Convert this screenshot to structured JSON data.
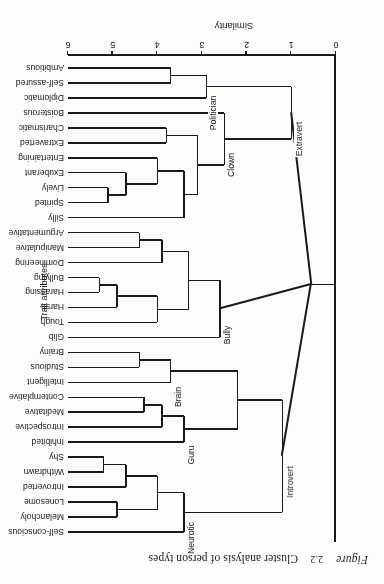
{
  "caption": {
    "figure_word": "Figure",
    "number": "2.2",
    "text": "Cluster analysis of person types"
  },
  "axes": {
    "x_label": "Similarity",
    "x_ticks": [
      "0",
      "1",
      "2",
      "3",
      "4",
      "5",
      "6"
    ],
    "x_min": 0,
    "x_max": 6,
    "right_label": "Trait attributes"
  },
  "chart_data": {
    "type": "dendrogram",
    "title": "Cluster analysis of person types",
    "xlabel": "Similarity",
    "ylabel": "Trait attributes",
    "xlim": [
      0,
      6
    ],
    "grid": false,
    "legend": "none",
    "orientation": "horizontal-rotated-180",
    "leaves": [
      "Self-conscious",
      "Melancholy",
      "Lonesome",
      "Introverted",
      "Withdrawn",
      "Shy",
      "Inhibited",
      "Introspective",
      "Meditative",
      "Contemplative",
      "Intelligent",
      "Studious",
      "Brainy",
      "Glib",
      "Tough",
      "Harsh",
      "Harassing",
      "Bullying",
      "Domineering",
      "Manipulative",
      "Argumentative",
      "Silly",
      "Spirited",
      "Lively",
      "Exuberant",
      "Entertaining",
      "Extraverted",
      "Charismatic",
      "Boisterous",
      "Diplomatic",
      "Self-assured",
      "Ambitious"
    ],
    "cluster_labels": [
      "Neurotic",
      "Guru",
      "Brain",
      "Introvert",
      "Bully",
      "Clown",
      "Politician",
      "Extravert"
    ],
    "merges": [
      {
        "name": "Withdrawn-Shy",
        "height": 5.2,
        "members": [
          "Withdrawn",
          "Shy"
        ]
      },
      {
        "name": "Introverted-WithdrawnShy",
        "height": 4.7,
        "members": [
          "Introverted",
          "Withdrawn",
          "Shy"
        ]
      },
      {
        "name": "Melancholy-Lonesome",
        "height": 4.9,
        "members": [
          "Melancholy",
          "Lonesome"
        ]
      },
      {
        "name": "Neurotic-inner",
        "height": 4.0,
        "members": [
          "Melancholy",
          "Lonesome",
          "Introverted",
          "Withdrawn",
          "Shy"
        ]
      },
      {
        "name": "Neurotic",
        "height": 3.4,
        "members": [
          "Self-conscious",
          "Melancholy",
          "Lonesome",
          "Introverted",
          "Withdrawn",
          "Shy"
        ]
      },
      {
        "name": "Meditative-Contemplative",
        "height": 4.3,
        "members": [
          "Meditative",
          "Contemplative"
        ]
      },
      {
        "name": "Guru",
        "height": 3.4,
        "members": [
          "Inhibited",
          "Introspective",
          "Meditative",
          "Contemplative"
        ]
      },
      {
        "name": "Studious-Brainy",
        "height": 4.4,
        "members": [
          "Studious",
          "Brainy"
        ]
      },
      {
        "name": "Brain",
        "height": 3.7,
        "members": [
          "Intelligent",
          "Studious",
          "Brainy"
        ]
      },
      {
        "name": "Guru-Brain",
        "height": 2.2,
        "members": [
          "Guru",
          "Brain"
        ]
      },
      {
        "name": "Introvert",
        "height": 1.2,
        "members": [
          "Neurotic",
          "Guru",
          "Brain"
        ]
      },
      {
        "name": "Harassing-Bullying",
        "height": 5.3,
        "members": [
          "Harassing",
          "Bullying"
        ]
      },
      {
        "name": "Harsh-HarassingBullying",
        "height": 4.9,
        "members": [
          "Harsh",
          "Harassing",
          "Bullying"
        ]
      },
      {
        "name": "Tough-group",
        "height": 4.0,
        "members": [
          "Tough",
          "Harsh",
          "Harassing",
          "Bullying"
        ]
      },
      {
        "name": "Manipulative-Argumentative",
        "height": 4.4,
        "members": [
          "Manipulative",
          "Argumentative"
        ]
      },
      {
        "name": "Domineering-group",
        "height": 3.9,
        "members": [
          "Domineering",
          "Manipulative",
          "Argumentative"
        ]
      },
      {
        "name": "Bully-inner",
        "height": 3.3,
        "members": [
          "Tough",
          "Harsh",
          "Harassing",
          "Bullying",
          "Domineering",
          "Manipulative",
          "Argumentative"
        ]
      },
      {
        "name": "Bully",
        "height": 2.6,
        "members": [
          "Glib",
          "Tough",
          "Harsh",
          "Harassing",
          "Bullying",
          "Domineering",
          "Manipulative",
          "Argumentative"
        ]
      },
      {
        "name": "Spirited-Lively",
        "height": 5.1,
        "members": [
          "Spirited",
          "Lively"
        ]
      },
      {
        "name": "Exuberant-group",
        "height": 4.7,
        "members": [
          "Spirited",
          "Lively",
          "Exuberant"
        ]
      },
      {
        "name": "Entertaining-group",
        "height": 4.0,
        "members": [
          "Spirited",
          "Lively",
          "Exuberant",
          "Entertaining"
        ]
      },
      {
        "name": "Silly-group",
        "height": 3.4,
        "members": [
          "Silly",
          "Spirited",
          "Lively",
          "Exuberant",
          "Entertaining"
        ]
      },
      {
        "name": "Extraverted-Charismatic",
        "height": 3.8,
        "members": [
          "Extraverted",
          "Charismatic"
        ]
      },
      {
        "name": "Clown-inner",
        "height": 3.1,
        "members": [
          "Silly",
          "Spirited",
          "Lively",
          "Exuberant",
          "Entertaining",
          "Extraverted",
          "Charismatic"
        ]
      },
      {
        "name": "Clown",
        "height": 2.5,
        "members": [
          "Boisterous",
          "Silly",
          "Spirited",
          "Lively",
          "Exuberant",
          "Entertaining",
          "Extraverted",
          "Charismatic"
        ]
      },
      {
        "name": "Self-assured-Ambitious",
        "height": 3.7,
        "members": [
          "Self-assured",
          "Ambitious"
        ]
      },
      {
        "name": "Politician",
        "height": 2.9,
        "members": [
          "Diplomatic",
          "Self-assured",
          "Ambitious"
        ]
      },
      {
        "name": "Extravert",
        "height": 1.0,
        "members": [
          "Clown",
          "Politician"
        ]
      },
      {
        "name": "Root",
        "height": 0.55,
        "members": [
          "Introvert",
          "Bully",
          "Extravert"
        ]
      }
    ]
  }
}
